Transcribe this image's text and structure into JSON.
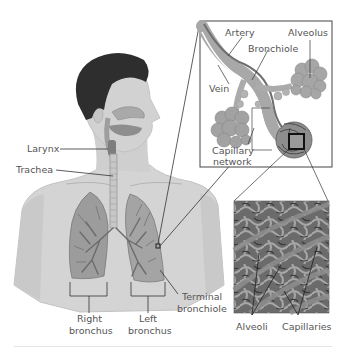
{
  "diagram": {
    "colors": {
      "background": "#ffffff",
      "skin": "#d6d6d6",
      "skin_shadow": "#bdbdbd",
      "hair": "#2e2e2e",
      "lung": "#9a9a9a",
      "lung_light": "#b4b4b4",
      "airway": "#6e6e6e",
      "alveolus": "#a8a8a8",
      "capillary_tile": "#6a6a6a",
      "leader_line": "#333333",
      "label_text": "#555555"
    },
    "body_labels": {
      "larynx": "Larynx",
      "trachea": "Trachea",
      "right_bronchus_1": "Right",
      "right_bronchus_2": "bronchus",
      "left_bronchus_1": "Left",
      "left_bronchus_2": "bronchus",
      "terminal_bronchiole_1": "Terminal",
      "terminal_bronchiole_2": "bronchiole"
    },
    "inset_top": {
      "labels": {
        "artery": "Artery",
        "alveolus": "Alveolus",
        "bronchiole": "Bronchiole",
        "vein": "Vein",
        "capillary_network_1": "Capillary",
        "capillary_network_2": "network"
      }
    },
    "inset_bottom": {
      "labels": {
        "alveoli": "Alveoli",
        "capillaries": "Capillaries"
      }
    }
  }
}
